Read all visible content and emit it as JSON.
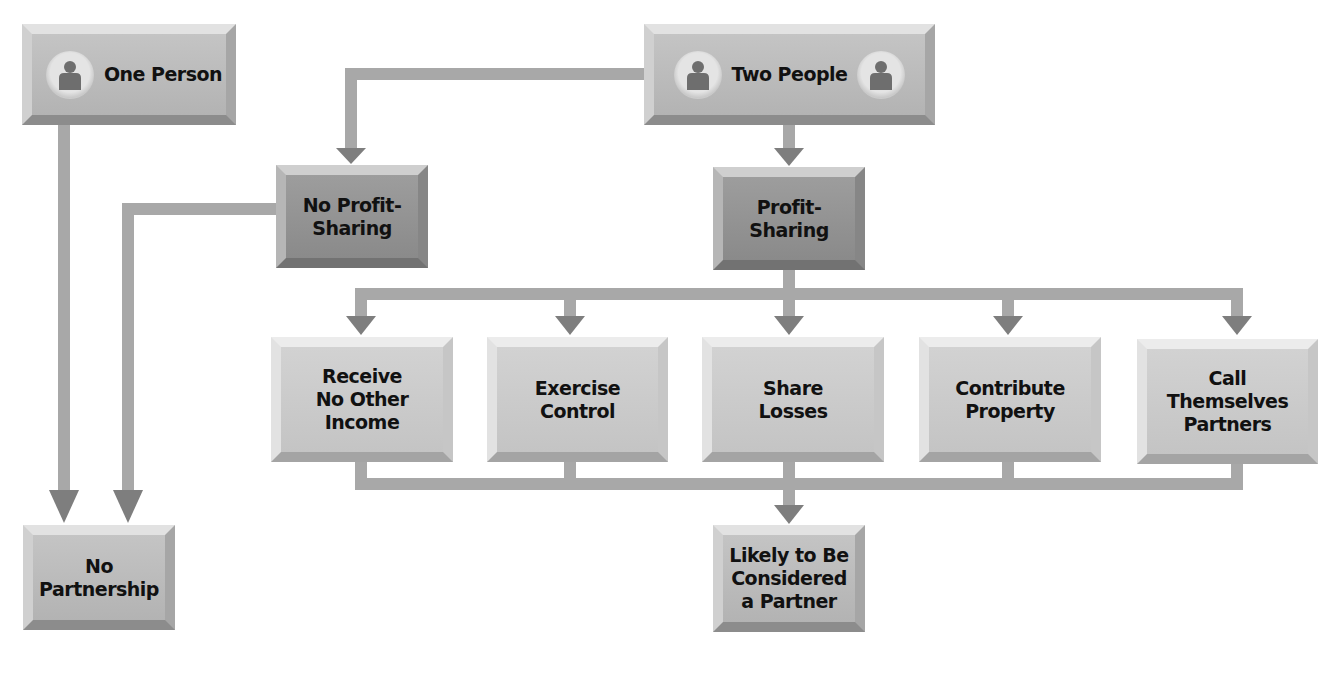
{
  "diagram": {
    "nodes": {
      "one_person": {
        "label": "One Person",
        "icon": "person-icon"
      },
      "two_people": {
        "label": "Two People",
        "icons": [
          "person-icon",
          "person-icon"
        ]
      },
      "no_profit_sharing": {
        "label": "No Profit-\nSharing"
      },
      "profit_sharing": {
        "label": "Profit-\nSharing"
      },
      "receive_no_other_income": {
        "label": "Receive\nNo Other\nIncome"
      },
      "exercise_control": {
        "label": "Exercise\nControl"
      },
      "share_losses": {
        "label": "Share\nLosses"
      },
      "contribute_property": {
        "label": "Contribute\nProperty"
      },
      "call_themselves_partners": {
        "label": "Call\nThemselves\nPartners"
      },
      "no_partnership": {
        "label": "No\nPartnership"
      },
      "likely_partner": {
        "label": "Likely to Be\nConsidered\na Partner"
      }
    },
    "edges": [
      {
        "from": "one_person",
        "to": "no_partnership"
      },
      {
        "from": "two_people",
        "to": "no_profit_sharing"
      },
      {
        "from": "two_people",
        "to": "profit_sharing"
      },
      {
        "from": "no_profit_sharing",
        "to": "no_partnership"
      },
      {
        "from": "profit_sharing",
        "to": "receive_no_other_income"
      },
      {
        "from": "profit_sharing",
        "to": "exercise_control"
      },
      {
        "from": "profit_sharing",
        "to": "share_losses"
      },
      {
        "from": "profit_sharing",
        "to": "contribute_property"
      },
      {
        "from": "profit_sharing",
        "to": "call_themselves_partners"
      },
      {
        "from": "receive_no_other_income",
        "to": "likely_partner"
      },
      {
        "from": "exercise_control",
        "to": "likely_partner"
      },
      {
        "from": "share_losses",
        "to": "likely_partner"
      },
      {
        "from": "contribute_property",
        "to": "likely_partner"
      },
      {
        "from": "call_themselves_partners",
        "to": "likely_partner"
      }
    ],
    "colors": {
      "connector": "#9a9a9a",
      "arrowhead": "#7e7e7e",
      "dark_box": "#929292",
      "light_box": "#cbcbcb"
    }
  }
}
